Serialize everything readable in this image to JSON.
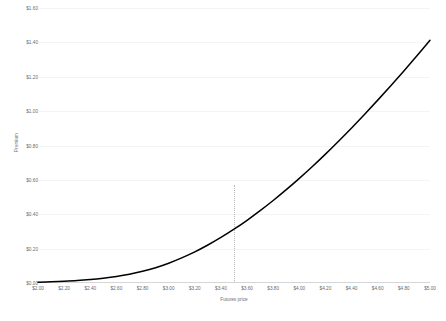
{
  "chart_data": {
    "type": "line",
    "title": "",
    "xlabel": "Futures price",
    "ylabel": "Premium",
    "xlim": [
      2.0,
      5.0
    ],
    "ylim": [
      0.0,
      1.6
    ],
    "grid": true,
    "legend": false,
    "x_tick_labels": [
      "$2.00",
      "$2.20",
      "$2.40",
      "$2.60",
      "$2.80",
      "$3.00",
      "$3.20",
      "$3.40",
      "$3.60",
      "$3.80",
      "$4.00",
      "$4.20",
      "$4.40",
      "$4.60",
      "$4.80",
      "$5.00"
    ],
    "x_ticks": [
      2.0,
      2.2,
      2.4,
      2.6,
      2.8,
      3.0,
      3.2,
      3.4,
      3.6,
      3.8,
      4.0,
      4.2,
      4.4,
      4.6,
      4.8,
      5.0
    ],
    "y_tick_labels": [
      "$0.00",
      "$0.20",
      "$0.40",
      "$0.60",
      "$0.80",
      "$1.00",
      "$1.20",
      "$1.40",
      "$1.60"
    ],
    "y_ticks": [
      0.0,
      0.2,
      0.4,
      0.6,
      0.8,
      1.0,
      1.2,
      1.4,
      1.6
    ],
    "series": [
      {
        "name": "Premium",
        "color": "#000000",
        "x": [
          2.0,
          2.1,
          2.2,
          2.3,
          2.4,
          2.5,
          2.6,
          2.7,
          2.8,
          2.9,
          3.0,
          3.1,
          3.2,
          3.3,
          3.4,
          3.5,
          3.6,
          3.7,
          3.8,
          3.9,
          4.0,
          4.1,
          4.2,
          4.3,
          4.4,
          4.5,
          4.6,
          4.7,
          4.8,
          4.9,
          5.0
        ],
        "y": [
          0.005,
          0.007,
          0.01,
          0.014,
          0.02,
          0.028,
          0.038,
          0.051,
          0.068,
          0.089,
          0.115,
          0.146,
          0.181,
          0.221,
          0.265,
          0.313,
          0.365,
          0.421,
          0.48,
          0.543,
          0.609,
          0.678,
          0.75,
          0.825,
          0.902,
          0.982,
          1.064,
          1.148,
          1.234,
          1.322,
          1.412
        ]
      }
    ],
    "annotations": [
      {
        "type": "vertical-dotted-line",
        "x": 3.5,
        "y_top": 0.57,
        "y_bottom": 0.0,
        "color": "#b9b9b9"
      }
    ]
  }
}
